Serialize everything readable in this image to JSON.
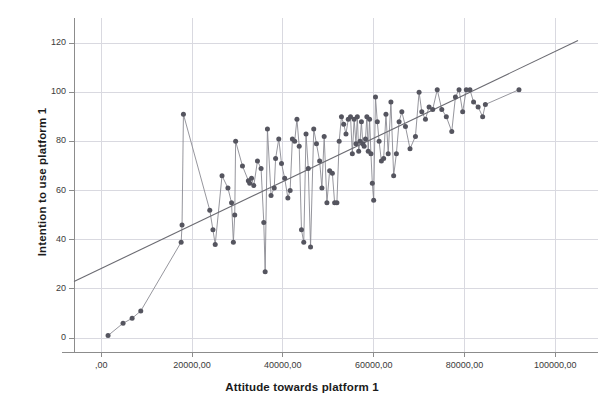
{
  "chart_data": {
    "type": "scatter",
    "title": "",
    "xlabel": "Attitude towards platform 1",
    "ylabel": "Intention to use platform 1",
    "xlim": [
      -6000,
      105000
    ],
    "ylim": [
      -6,
      126
    ],
    "grid": true,
    "legend": false,
    "connected": true,
    "xticks": [
      0,
      20000,
      40000,
      60000,
      80000,
      100000
    ],
    "xticklabels": [
      ",00",
      "20000,00",
      "40000,00",
      "60000,00",
      "80000,00",
      "100000,00"
    ],
    "yticks": [
      0,
      20,
      40,
      60,
      80,
      100,
      120
    ],
    "yticklabels": [
      "0",
      "20",
      "40",
      "60",
      "80",
      "100",
      "120"
    ],
    "marker_color": "#55555f",
    "line_color": "#8a8a92",
    "fitline_color": "#6b6b72",
    "grid_color": "#d9d9e0",
    "axis_color": "#8c8c8c",
    "marker_size": 5,
    "fit_line": {
      "label": "linear fit",
      "x": [
        -6000,
        105000
      ],
      "y": [
        23,
        121
      ]
    },
    "x": [
      1500,
      4800,
      6800,
      8700,
      17600,
      17800,
      18100,
      23900,
      24600,
      25100,
      26600,
      27900,
      28700,
      29100,
      29400,
      29600,
      31100,
      32400,
      32700,
      33100,
      33600,
      34400,
      35200,
      35800,
      36100,
      36600,
      37400,
      38100,
      38400,
      39100,
      39700,
      40400,
      41100,
      41600,
      42100,
      42600,
      43100,
      43600,
      44100,
      44600,
      45100,
      45600,
      46100,
      46800,
      47400,
      48100,
      48600,
      49100,
      49700,
      50300,
      50900,
      51400,
      51900,
      52400,
      52900,
      53400,
      53900,
      54400,
      54900,
      55300,
      55700,
      56100,
      56400,
      56700,
      57000,
      57300,
      57600,
      57900,
      58200,
      58500,
      58800,
      59100,
      59400,
      59700,
      60000,
      60400,
      60800,
      61200,
      61700,
      62200,
      62700,
      63200,
      63800,
      64400,
      65000,
      65600,
      66200,
      67000,
      68000,
      69200,
      70000,
      70600,
      71400,
      72200,
      73000,
      74000,
      75000,
      76000,
      77200,
      78000,
      78800,
      79600,
      80400,
      81200,
      82000,
      83000,
      84000,
      84600,
      92000
    ],
    "y": [
      1,
      6,
      8,
      11,
      39,
      46,
      91,
      52,
      44,
      38,
      66,
      61,
      55,
      39,
      50,
      80,
      70,
      64,
      63,
      65,
      62,
      72,
      69,
      47,
      27,
      85,
      58,
      61,
      73,
      81,
      71,
      65,
      57,
      60,
      81,
      80,
      89,
      78,
      44,
      39,
      83,
      69,
      37,
      85,
      79,
      72,
      61,
      82,
      55,
      68,
      67,
      55,
      55,
      80,
      90,
      87,
      83,
      89,
      90,
      75,
      89,
      79,
      90,
      76,
      80,
      88,
      79,
      78,
      81,
      90,
      76,
      89,
      75,
      63,
      56,
      98,
      88,
      80,
      72,
      73,
      91,
      75,
      96,
      66,
      75,
      88,
      92,
      86,
      77,
      82,
      100,
      92,
      89,
      94,
      93,
      101,
      93,
      90,
      84,
      98,
      101,
      92,
      101,
      101,
      96,
      94,
      90,
      95,
      101
    ]
  }
}
